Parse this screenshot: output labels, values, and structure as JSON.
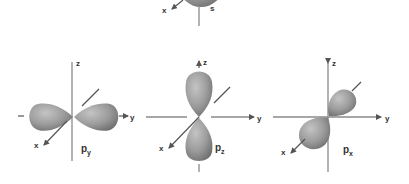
{
  "figure": {
    "colors": {
      "lobe_light": "#bdbdbd",
      "lobe_mid": "#9a9a9a",
      "lobe_dark": "#6f6f6f",
      "axis": "#8a8a8a",
      "label": "#333333"
    },
    "s_orbital": {
      "label": "s",
      "axis_labels": {
        "x": "x"
      }
    },
    "orbitals": [
      {
        "id": "py",
        "label_main": "p",
        "label_sub": "y",
        "axis_labels": {
          "z": "z",
          "y": "y",
          "x": "x"
        },
        "lobe_orientation": "y"
      },
      {
        "id": "pz",
        "label_main": "p",
        "label_sub": "z",
        "axis_labels": {
          "z": "z",
          "y": "y",
          "x": "x"
        },
        "lobe_orientation": "z"
      },
      {
        "id": "px",
        "label_main": "p",
        "label_sub": "x",
        "axis_labels": {
          "z": "z",
          "y": "y",
          "x": "x"
        },
        "lobe_orientation": "x"
      }
    ]
  }
}
